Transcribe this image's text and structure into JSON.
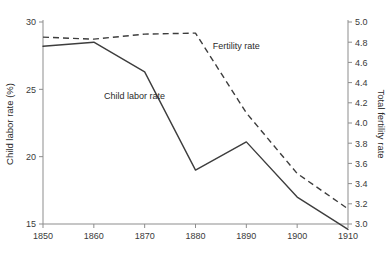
{
  "chart_data": {
    "type": "line",
    "title": "",
    "xlabel": "",
    "ylabel": "Child labor rate (%)",
    "y2label": "Total fertility rate",
    "grid": false,
    "legend_position": "inline-annotations",
    "x": [
      1850,
      1860,
      1870,
      1880,
      1890,
      1900,
      1910
    ],
    "xlim": [
      1850,
      1910
    ],
    "xticks": [
      "1850",
      "1860",
      "1870",
      "1880",
      "1890",
      "1900",
      "1910"
    ],
    "ylim": [
      15,
      30
    ],
    "yticks": [
      "30",
      "25",
      "20",
      "15"
    ],
    "ytick_values": [
      30,
      25,
      20,
      15
    ],
    "y2lim": [
      3.0,
      5.0
    ],
    "y2ticks": [
      "5.0",
      "4.8",
      "4.6",
      "4.4",
      "4.2",
      "4.0",
      "3.8",
      "3.6",
      "3.4",
      "3.2",
      "3.0"
    ],
    "y2tick_values": [
      5.0,
      4.8,
      4.6,
      4.4,
      4.2,
      4.0,
      3.8,
      3.6,
      3.4,
      3.2,
      3.0
    ],
    "series": [
      {
        "name": "Child labor rate",
        "axis": "left",
        "style": "solid",
        "color": "#3d3d3d",
        "label_x": 1868,
        "label_y": 24.3,
        "values": [
          28.2,
          28.5,
          26.3,
          19.0,
          21.1,
          17.0,
          14.6
        ]
      },
      {
        "name": "Fertility rate",
        "axis": "right",
        "style": "dashed",
        "color": "#3d3d3d",
        "label_x": 1888,
        "label_y": 4.73,
        "values": [
          4.85,
          4.83,
          4.88,
          4.89,
          4.1,
          3.5,
          3.15
        ]
      }
    ]
  }
}
